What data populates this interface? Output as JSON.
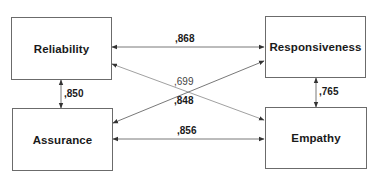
{
  "nodes": {
    "reliability": {
      "label": "Reliability"
    },
    "responsiveness": {
      "label": "Responsiveness"
    },
    "assurance": {
      "label": "Assurance"
    },
    "empathy": {
      "label": "Empathy"
    }
  },
  "edges": [
    {
      "from": "Reliability",
      "to": "Responsiveness",
      "coefficient": ",868"
    },
    {
      "from": "Reliability",
      "to": "Assurance",
      "coefficient": ",850"
    },
    {
      "from": "Reliability",
      "to": "Empathy",
      "coefficient": ",699"
    },
    {
      "from": "Assurance",
      "to": "Responsiveness",
      "coefficient": ",848"
    },
    {
      "from": "Assurance",
      "to": "Empathy",
      "coefficient": ",856"
    },
    {
      "from": "Responsiveness",
      "to": "Empathy",
      "coefficient": ",765"
    }
  ],
  "colors": {
    "line": "#555555",
    "text": "#1a1a1a",
    "border": "#6b6b6b"
  }
}
